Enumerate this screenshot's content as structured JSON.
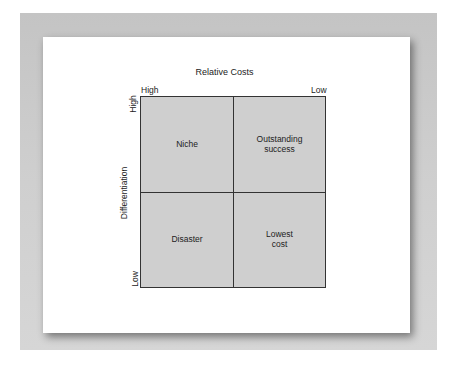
{
  "diagram": {
    "title": "Relative Costs",
    "x_axis": {
      "left_label": "High",
      "right_label": "Low"
    },
    "y_axis": {
      "label": "Differentiation",
      "top_label": "High",
      "bottom_label": "Low"
    },
    "quadrants": [
      {
        "position": "top-left",
        "label": "Niche"
      },
      {
        "position": "top-right",
        "label": "Outstanding success"
      },
      {
        "position": "bottom-left",
        "label": "Disaster"
      },
      {
        "position": "bottom-right",
        "label": "Lowest cost"
      }
    ]
  },
  "colors": {
    "quadrant_fill": "#cfcfcf",
    "frame": "#c8c8c8",
    "grid_line": "#333333"
  }
}
